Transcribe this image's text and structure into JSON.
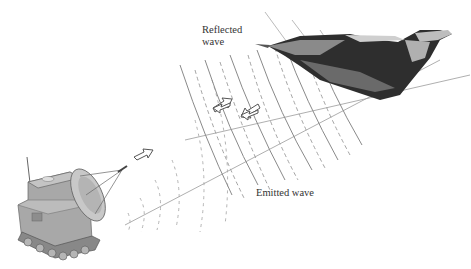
{
  "diagram": {
    "labels": {
      "reflected": "Reflected wave",
      "reflected_line1": "Reflected",
      "reflected_line2": "wave",
      "emitted": "Emitted wave"
    },
    "elements": {
      "radar_vehicle": "tracked-radar-vehicle",
      "antenna": "parabolic-dish-antenna",
      "target": "jet-aircraft",
      "emitted_arrow": "arrow-right-up",
      "reflected_arrows": [
        "arrow-left-down",
        "arrow-left-down"
      ]
    },
    "colors": {
      "wave_line": "#8a8a8a",
      "vehicle": "#9a9a9a",
      "aircraft": "#2a2a2a",
      "text": "#333333"
    }
  }
}
